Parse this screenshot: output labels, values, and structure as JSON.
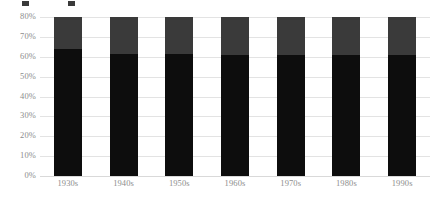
{
  "chart_data": {
    "type": "bar",
    "stacked": true,
    "title": "",
    "subtitle": "",
    "xlabel": "",
    "ylabel": "",
    "categories": [
      "1930s",
      "1940s",
      "1950s",
      "1960s",
      "1970s",
      "1980s",
      "1990s"
    ],
    "series": [
      {
        "name": "",
        "color": "#0d0d0d",
        "values": [
          64,
          61.5,
          61.5,
          61,
          61,
          61,
          61
        ]
      },
      {
        "name": "",
        "color": "#3a3a3a",
        "values": [
          16,
          18.5,
          18.5,
          19,
          19,
          19,
          19
        ]
      }
    ],
    "totals": [
      80,
      80,
      80,
      80,
      80,
      80,
      80
    ],
    "ylim": [
      0,
      80
    ],
    "ytick_values": [
      0,
      10,
      20,
      30,
      40,
      50,
      60,
      70,
      80
    ],
    "ytick_labels": [
      "0%",
      "10%",
      "20%",
      "30%",
      "40%",
      "50%",
      "60%",
      "70%",
      "80%"
    ],
    "grid": true,
    "grid_axis": "y",
    "legend_position": "top-left",
    "legend_visible_partial": true,
    "value_suffix": "%"
  },
  "legend": {
    "entries": [
      {
        "label": "",
        "color": "#3a3a3a"
      },
      {
        "label": "",
        "color": "#3a3a3a"
      }
    ]
  },
  "colors": {
    "gridline": "#e3e3e3",
    "axis_text": "#8d8d8d",
    "background": "#ffffff",
    "series_dark": "#0d0d0d",
    "series_gray": "#3a3a3a"
  }
}
